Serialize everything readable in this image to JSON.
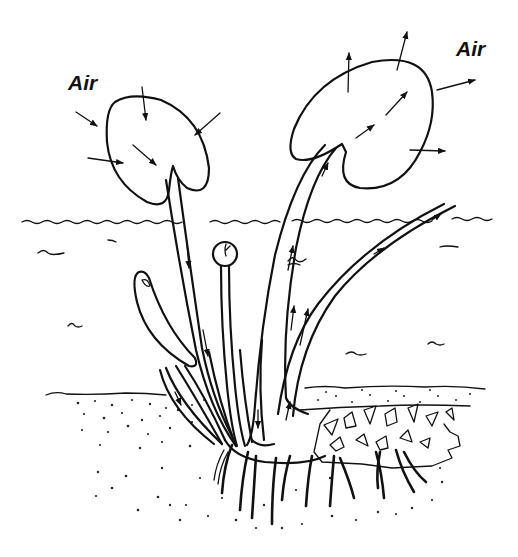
{
  "diagram": {
    "labels": {
      "air_left": "Air",
      "air_right": "Air"
    },
    "parts": [
      "young-leaf (air in)",
      "old-leaf (air out)",
      "downflow-petiole",
      "upflow-petiole",
      "emergent-petiole",
      "flower-bud",
      "submerged-leaf",
      "rhizome",
      "roots",
      "water-surface",
      "sediment-surface"
    ],
    "colors": {
      "ink": "#111111",
      "background": "#ffffff"
    }
  }
}
